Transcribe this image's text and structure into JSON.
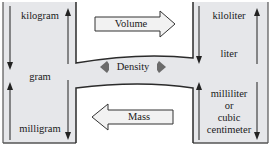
{
  "diagram": {
    "left_column": {
      "units": [
        "kilogram",
        "gram",
        "milligram"
      ]
    },
    "right_column": {
      "units": [
        "kiloliter",
        "liter",
        "milliliter",
        "or",
        "cubic",
        "centimeter"
      ]
    },
    "arrows": {
      "volume": "Volume",
      "density": "Density",
      "mass": "Mass"
    },
    "colors": {
      "panel_fill": "#e6e7ea",
      "outline": "#2b2b2b",
      "arrow_fill": "#f2f2f2",
      "density_arrow": "#6b6b6b"
    }
  }
}
